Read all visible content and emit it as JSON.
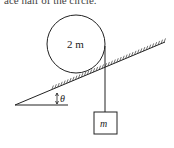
{
  "caption_fragment": "ace half of the circle.",
  "diagram": {
    "cylinder_label": "2 m",
    "block_label": "m",
    "angle_label": "θ",
    "colors": {
      "line": "#222222",
      "background": "#ffffff"
    }
  }
}
